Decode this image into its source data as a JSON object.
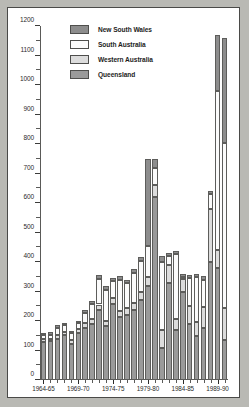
{
  "figure": {
    "background": "#b9b9b4",
    "card_background": "#ffffff",
    "border_color": "#4a4a48"
  },
  "legend": {
    "position": "top-left-inside",
    "entries": [
      {
        "label": "New South Wales",
        "color": "#8d8d8d",
        "key": "nsw"
      },
      {
        "label": "South Australia",
        "color": "#fbfbfb",
        "key": "sa"
      },
      {
        "label": "Western Australia",
        "color": "#dcdcdc",
        "key": "wa"
      },
      {
        "label": "Queensland",
        "color": "#9a9a9a",
        "key": "qld"
      }
    ]
  },
  "chart_data": {
    "type": "bar",
    "subtype": "stacked-vertical",
    "title": "",
    "xlabel": "",
    "ylabel": "",
    "ylim": [
      0,
      1200
    ],
    "ytick_step": 100,
    "yminor_step": 50,
    "grid": false,
    "ytick_labels": [
      "0",
      "100",
      "200",
      "300",
      "400",
      "500",
      "600",
      "700",
      "800",
      "900",
      "1000",
      "1100",
      "1200"
    ],
    "ytick_values": [
      0,
      100,
      200,
      300,
      400,
      500,
      600,
      700,
      800,
      900,
      1000,
      1100,
      1200
    ],
    "categories": [
      "1964-65",
      "1965-66",
      "1966-67",
      "1967-68",
      "1968-69",
      "1969-70",
      "1970-71",
      "1971-72",
      "1972-73",
      "1973-74",
      "1974-75",
      "1975-76",
      "1976-77",
      "1977-78",
      "1978-79",
      "1979-80",
      "1980-81",
      "1981-82",
      "1982-83",
      "1983-84",
      "1984-85",
      "1985-86",
      "1986-87",
      "1987-88",
      "1988-89",
      "1989-90",
      "1990-91"
    ],
    "xtick_labeled": [
      "1964-65",
      "1969-70",
      "1974-75",
      "1979-80",
      "1984-85",
      "1989-90"
    ],
    "xtick_labeled_index": [
      0,
      5,
      10,
      15,
      20,
      25
    ],
    "series": [
      {
        "name": "Queensland",
        "key": "qld",
        "color": "#9a9a9a",
        "values": [
          130,
          132,
          140,
          152,
          122,
          160,
          178,
          190,
          238,
          184,
          256,
          212,
          222,
          238,
          272,
          320,
          620,
          110,
          330,
          168,
          300,
          190,
          150,
          178,
          400,
          380,
          135
        ]
      },
      {
        "name": "Western Australia",
        "key": "wa",
        "color": "#dcdcdc",
        "values": [
          8,
          8,
          14,
          12,
          14,
          12,
          16,
          16,
          18,
          16,
          22,
          22,
          22,
          22,
          26,
          28,
          40,
          60,
          60,
          40,
          42,
          60,
          48,
          70,
          180,
          60,
          110
        ]
      },
      {
        "name": "South Australia",
        "key": "sa",
        "color": "#fbfbfb",
        "values": [
          14,
          14,
          24,
          22,
          22,
          20,
          34,
          52,
          88,
          106,
          56,
          106,
          84,
          104,
          104,
          106,
          60,
          230,
          32,
          220,
          8,
          96,
          150,
          92,
          50,
          540,
          560
        ]
      },
      {
        "name": "New South Wales",
        "key": "nsw",
        "color": "#8d8d8d",
        "values": [
          8,
          8,
          8,
          8,
          8,
          8,
          10,
          10,
          12,
          12,
          12,
          12,
          12,
          12,
          16,
          296,
          30,
          20,
          10,
          10,
          10,
          10,
          10,
          12,
          10,
          190,
          355
        ]
      }
    ],
    "totals": [
      160,
      162,
      186,
      194,
      166,
      200,
      238,
      268,
      356,
      318,
      346,
      352,
      340,
      376,
      418,
      750,
      750,
      420,
      432,
      438,
      360,
      356,
      358,
      352,
      640,
      1170,
      1160
    ]
  }
}
